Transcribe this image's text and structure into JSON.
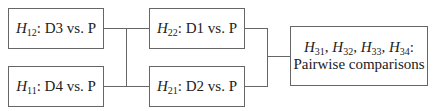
{
  "diagram": {
    "type": "hierarchical hypothesis testing tree",
    "nodes": [
      {
        "id": "H12",
        "hyp": "H",
        "sub": "12",
        "label": ": D3 vs. P",
        "level": 1
      },
      {
        "id": "H11",
        "hyp": "H",
        "sub": "11",
        "label": ": D4 vs. P",
        "level": 1
      },
      {
        "id": "H22",
        "hyp": "H",
        "sub": "22",
        "label": ": D1 vs. P",
        "level": 2
      },
      {
        "id": "H21",
        "hyp": "H",
        "sub": "21",
        "label": ": D2 vs. P",
        "level": 2
      },
      {
        "id": "H3",
        "level": 3,
        "hyps": [
          {
            "hyp": "H",
            "sub": "31",
            "sep": ", "
          },
          {
            "hyp": "H",
            "sub": "32",
            "sep": ", "
          },
          {
            "hyp": "H",
            "sub": "33",
            "sep": ", "
          },
          {
            "hyp": "H",
            "sub": "34",
            "sep": ":"
          }
        ],
        "line2": "Pairwise comparisons"
      }
    ],
    "edges": [
      {
        "from": [
          "H12",
          "H11"
        ],
        "to": [
          "H22",
          "H21"
        ]
      },
      {
        "from": [
          "H22",
          "H21"
        ],
        "to": [
          "H3"
        ]
      }
    ],
    "colors": {
      "border": "#666666",
      "text": "#222222",
      "background": "#ffffff"
    }
  }
}
